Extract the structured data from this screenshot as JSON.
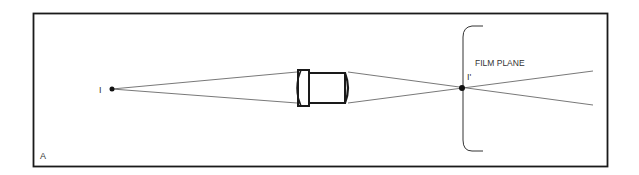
{
  "diagram": {
    "panel_label": "A",
    "object_point_label": "I",
    "image_point_label": "I'",
    "film_plane_label": "FILM PLANE",
    "colors": {
      "stroke": "#1a1a1a",
      "ray": "#555555",
      "background": "#ffffff"
    },
    "elements": [
      {
        "type": "point",
        "name": "object point I",
        "x": 112,
        "y": 89
      },
      {
        "type": "lens",
        "name": "camera lens",
        "x": 295,
        "y": 70
      },
      {
        "type": "point",
        "name": "image point I'",
        "x": 462,
        "y": 88
      },
      {
        "type": "bracket",
        "name": "film plane",
        "x": 463,
        "y_top": 26,
        "y_bottom": 151
      }
    ]
  }
}
